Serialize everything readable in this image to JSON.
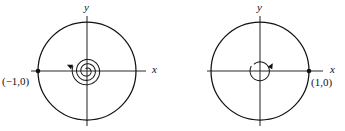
{
  "figure": {
    "width": 345,
    "height": 131,
    "background": "#ffffff",
    "ink_color": "#111111",
    "axis_color": "#2b2b2b"
  },
  "panels": [
    {
      "id": "left-panel",
      "name": "unstable-spiral-phase-portrait",
      "center": {
        "x": 87,
        "y": 71
      },
      "orbit_radius": 49,
      "axes": {
        "x_label": "x",
        "y_label": "y",
        "x_label_pos": {
          "x": 152,
          "y": 73
        },
        "y_label_pos": {
          "x": 84,
          "y": 11
        },
        "x_min": 31,
        "x_max": 146,
        "y_min": 16,
        "y_max": 126
      },
      "marked_point": {
        "label": "(−1,0)",
        "dot": {
          "x": 38,
          "y": 71
        },
        "label_pos": {
          "x": 2,
          "y": 85
        }
      },
      "spiral": {
        "direction": "inward",
        "turns": 2.9,
        "outer_radius": 15,
        "inner_radius": 2.5,
        "arrow_at": {
          "x": 72,
          "y": 67
        },
        "arrow_angle": 205
      }
    },
    {
      "id": "right-panel",
      "name": "center-orbit-phase-portrait",
      "center": {
        "x": 260,
        "y": 71
      },
      "orbit_radius": 49,
      "axes": {
        "x_label": "x",
        "y_label": "y",
        "x_label_pos": {
          "x": 330,
          "y": 73
        },
        "y_label_pos": {
          "x": 257,
          "y": 11
        },
        "x_min": 207,
        "x_max": 323,
        "y_min": 16,
        "y_max": 126
      },
      "marked_point": {
        "label": "(1,0)",
        "dot": {
          "x": 309,
          "y": 71
        },
        "label_pos": {
          "x": 311,
          "y": 86
        }
      },
      "spiral": {
        "direction": "loop",
        "turns": 0.95,
        "outer_radius": 10,
        "inner_radius": 9,
        "arrow_at": {
          "x": 270,
          "y": 68
        },
        "arrow_angle": 300
      }
    }
  ]
}
